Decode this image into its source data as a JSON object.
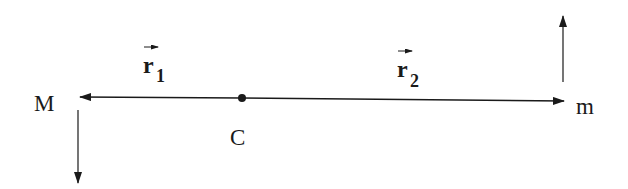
{
  "labels": {
    "mass_left": "M",
    "mass_right": "m",
    "center": "C",
    "r1_base": "r",
    "r1_sub": "1",
    "r2_base": "r",
    "r2_sub": "2"
  },
  "colors": {
    "stroke": "#1a1a1a",
    "background": "#ffffff"
  }
}
